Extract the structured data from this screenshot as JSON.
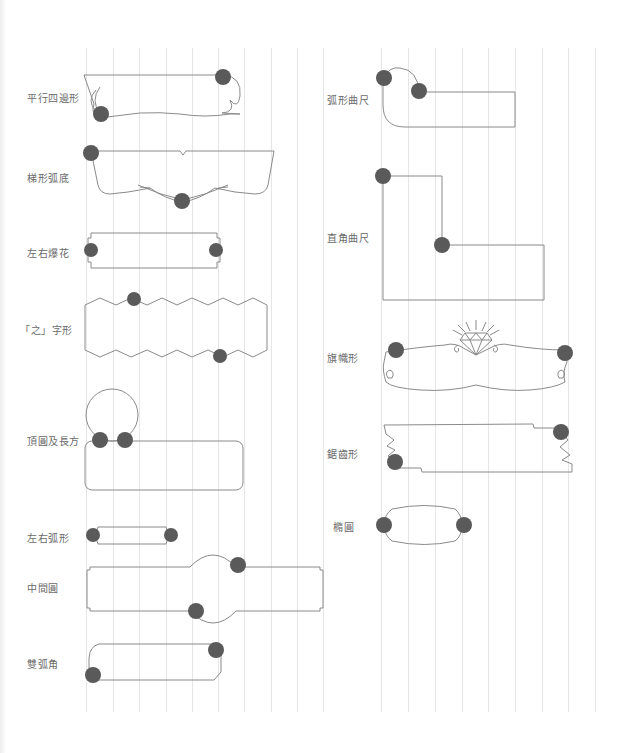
{
  "page": {
    "grid_lines_x": [
      86,
      113,
      139,
      166,
      192,
      218,
      244,
      271,
      297,
      323,
      381,
      408,
      435,
      462,
      488,
      515,
      542,
      568,
      595
    ],
    "colors": {
      "outline": "#8a8a8a",
      "badge": "#5a5a5a",
      "label": "#6a6a6a",
      "grid": "#e6e6e6"
    }
  },
  "left_column": {
    "shapes": [
      {
        "id": "parallelogram",
        "label": "平行四邊形",
        "label_x": 27,
        "label_y": 90
      },
      {
        "id": "trapezoid-arc-bottom",
        "label": "梯形弧底",
        "label_x": 27,
        "label_y": 170
      },
      {
        "id": "left-right-burst",
        "label": "左右爆花",
        "label_x": 27,
        "label_y": 245
      },
      {
        "id": "zigzag",
        "label": "「之」字形",
        "label_x": 20,
        "label_y": 322
      },
      {
        "id": "top-circle-rect",
        "label": "頂圓及長方",
        "label_x": 27,
        "label_y": 433
      },
      {
        "id": "left-right-arc",
        "label": "左右弧形",
        "label_x": 27,
        "label_y": 530
      },
      {
        "id": "middle-circle",
        "label": "中間圓",
        "label_x": 27,
        "label_y": 580
      },
      {
        "id": "double-arc-corner",
        "label": "雙弧角",
        "label_x": 27,
        "label_y": 656
      }
    ]
  },
  "right_column": {
    "shapes": [
      {
        "id": "arc-square-ruler",
        "label": "弧形曲尺",
        "label_x": 327,
        "label_y": 92
      },
      {
        "id": "right-angle-ruler",
        "label": "直角曲尺",
        "label_x": 327,
        "label_y": 230
      },
      {
        "id": "banner",
        "label": "旗幟形",
        "label_x": 327,
        "label_y": 350
      },
      {
        "id": "sawtooth",
        "label": "鋸齒形",
        "label_x": 327,
        "label_y": 446
      },
      {
        "id": "ellipse",
        "label": "橢圓",
        "label_x": 333,
        "label_y": 519
      }
    ]
  }
}
